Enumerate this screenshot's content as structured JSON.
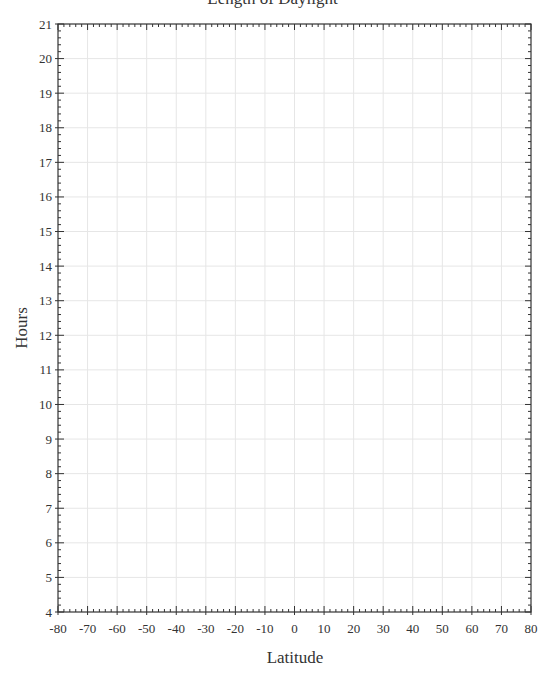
{
  "chart_data": {
    "type": "line",
    "title": "Length of Daylight",
    "xlabel": "Latitude",
    "ylabel": "Hours",
    "xlim": [
      -80,
      80
    ],
    "ylim": [
      4,
      21
    ],
    "x_ticks": [
      -80,
      -70,
      -60,
      -50,
      -40,
      -30,
      -20,
      -10,
      0,
      10,
      20,
      30,
      40,
      50,
      60,
      70,
      80
    ],
    "y_ticks": [
      4,
      5,
      6,
      7,
      8,
      9,
      10,
      11,
      12,
      13,
      14,
      15,
      16,
      17,
      18,
      19,
      20,
      21
    ],
    "x_minor_step": 2,
    "y_minor_step": 0.2,
    "grid": true,
    "series": [],
    "colors": {
      "axis": "#333333",
      "grid": "#e6e6e6",
      "text": "#333333"
    }
  }
}
